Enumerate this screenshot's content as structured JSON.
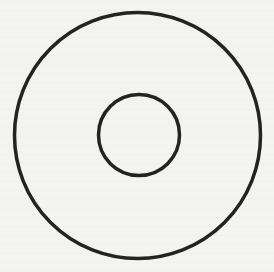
{
  "figure": {
    "type": "concentric-circles",
    "background_color": "#f3f3f1",
    "stroke_color": "#232323",
    "outer_circle": {
      "cx": 137.5,
      "cy": 135.5,
      "r": 123,
      "stroke_width": 3.5
    },
    "inner_circle": {
      "cx": 139,
      "cy": 135,
      "r": 40.5,
      "stroke_width": 3.5
    }
  }
}
